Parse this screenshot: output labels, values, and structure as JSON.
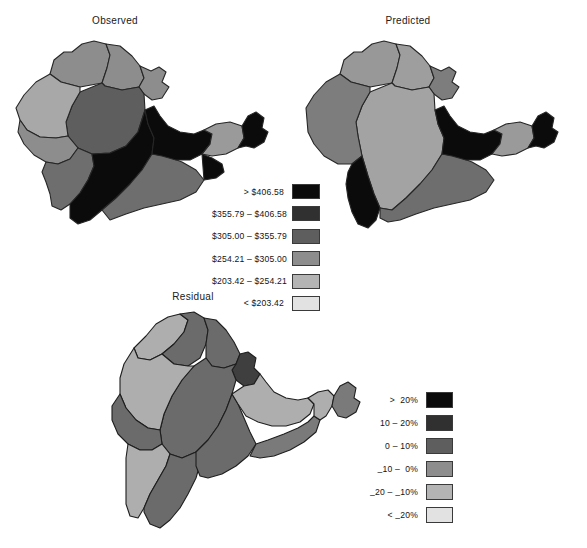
{
  "figure": {
    "background_color": "#ffffff",
    "maps": [
      {
        "id": "observed",
        "title": "Observed",
        "legend_ref": "currency"
      },
      {
        "id": "predicted",
        "title": "Predicted",
        "legend_ref": "currency"
      },
      {
        "id": "residual",
        "title": "Residual",
        "legend_ref": "residual"
      }
    ]
  },
  "legends": {
    "currency": {
      "rows": [
        {
          "label": "> $406.58",
          "color": "#0b0b0b"
        },
        {
          "label": "$355.79 – $406.58",
          "color": "#303030"
        },
        {
          "label": "$305.00 – $355.79",
          "color": "#5e5e5e"
        },
        {
          "label": "$254.21 – $305.00",
          "color": "#8d8d8d"
        },
        {
          "label": "$203.42 – $254.21",
          "color": "#b4b4b4"
        },
        {
          "label": "< $203.42",
          "color": "#e2e2e2"
        }
      ]
    },
    "residual": {
      "rows": [
        {
          "label_html": "&gt;&nbsp; 20%",
          "color": "#0b0b0b"
        },
        {
          "label_html": "10 &ndash; 20%",
          "color": "#303030"
        },
        {
          "label_html": "0 &ndash; 10%",
          "color": "#5e5e5e"
        },
        {
          "label_html": "<span class=\"minus-low\">&ndash;</span>10 &ndash;&nbsp; 0%",
          "color": "#8d8d8d"
        },
        {
          "label_html": "<span class=\"minus-low\">&ndash;</span>20 &ndash; <span class=\"minus-low\">&ndash;</span>10%",
          "color": "#b4b4b4"
        },
        {
          "label_html": "&lt; <span class=\"minus-low\">&ndash;</span>20%",
          "color": "#e2e2e2"
        }
      ]
    }
  },
  "chart_data": {
    "type": "map",
    "panels": [
      {
        "name": "Observed",
        "variable": "value (US dollars)",
        "class_breaks": [
          "< $203.42",
          "$203.42 – $254.21",
          "$254.21 – $305.00",
          "$305.00 – $355.79",
          "$355.79 – $406.58",
          "> $406.58"
        ],
        "regions": [
          {
            "id": "obs-nw",
            "class": "$305.00 – $355.79",
            "color": "#8d8d8d"
          },
          {
            "id": "obs-n",
            "class": "$254.21 – $305.00",
            "color": "#8d8d8d"
          },
          {
            "id": "obs-ne",
            "class": "$305.00 – $355.79",
            "color": "#8d8d8d"
          },
          {
            "id": "obs-ne-lobe",
            "class": "$355.79 – $406.58",
            "color": "#5e5e5e"
          },
          {
            "id": "obs-center",
            "class": "$254.21 – $305.00",
            "color": "#a8a8a8"
          },
          {
            "id": "obs-w",
            "class": "$254.21 – $305.00",
            "color": "#8d8d8d"
          },
          {
            "id": "obs-sw",
            "class": "$305.00 – $355.79",
            "color": "#6e6e6e"
          },
          {
            "id": "obs-s-dark",
            "class": "> $406.58",
            "color": "#0b0b0b"
          },
          {
            "id": "obs-se",
            "class": "$305.00 – $355.79",
            "color": "#6e6e6e"
          },
          {
            "id": "obs-e-dark",
            "class": "> $406.58",
            "color": "#0b0b0b"
          },
          {
            "id": "obs-e-light",
            "class": "$254.21 – $305.00",
            "color": "#9a9a9a"
          },
          {
            "id": "obs-tail-dark",
            "class": "> $406.58",
            "color": "#0b0b0b"
          }
        ]
      },
      {
        "name": "Predicted",
        "variable": "value (US dollars)",
        "class_breaks": [
          "< $203.42",
          "$203.42 – $254.21",
          "$254.21 – $305.00",
          "$305.00 – $355.79",
          "$355.79 – $406.58",
          "> $406.58"
        ],
        "regions": [
          {
            "id": "pre-nw",
            "class": "$254.21 – $305.00",
            "color": "#989898"
          },
          {
            "id": "pre-n",
            "class": "$254.21 – $305.00",
            "color": "#9e9e9e"
          },
          {
            "id": "pre-ne",
            "class": "$305.00 – $355.79",
            "color": "#7d7d7d"
          },
          {
            "id": "pre-center",
            "class": "$254.21 – $305.00",
            "color": "#a3a3a3"
          },
          {
            "id": "pre-w",
            "class": "$305.00 – $355.79",
            "color": "#7d7d7d"
          },
          {
            "id": "pre-sw-dark",
            "class": "> $406.58",
            "color": "#0b0b0b"
          },
          {
            "id": "pre-s",
            "class": "$305.00 – $355.79",
            "color": "#6e6e6e"
          },
          {
            "id": "pre-e-dark",
            "class": "> $406.58",
            "color": "#0b0b0b"
          },
          {
            "id": "pre-e-light",
            "class": "$254.21 – $305.00",
            "color": "#9a9a9a"
          },
          {
            "id": "pre-tail-dark",
            "class": "> $406.58",
            "color": "#0b0b0b"
          }
        ]
      },
      {
        "name": "Residual",
        "variable": "residual (percent)",
        "class_breaks": [
          "< –20%",
          "–20 – –10%",
          "–10 – 0%",
          "0 – 10%",
          "10 – 20%",
          "> 20%"
        ],
        "regions": [
          {
            "id": "res-nw-light",
            "class": "–20 – –10%",
            "color": "#aeaeae"
          },
          {
            "id": "res-n",
            "class": "0 – 10%",
            "color": "#6b6b6b"
          },
          {
            "id": "res-ne",
            "class": "0 – 10%",
            "color": "#6b6b6b"
          },
          {
            "id": "res-center",
            "class": "10 – 20%",
            "color": "#3f3f3f"
          },
          {
            "id": "res-w",
            "class": "0 – 10%",
            "color": "#6b6b6b"
          },
          {
            "id": "res-w-light",
            "class": "–20 – –10%",
            "color": "#aeaeae"
          },
          {
            "id": "res-sw",
            "class": "0 – 10%",
            "color": "#6b6b6b"
          },
          {
            "id": "res-s-light",
            "class": "–20 – –10%",
            "color": "#aeaeae"
          },
          {
            "id": "res-s",
            "class": "0 – 10%",
            "color": "#6b6b6b"
          },
          {
            "id": "res-e",
            "class": "0 – 10%",
            "color": "#6b6b6b"
          },
          {
            "id": "res-e-light",
            "class": "–20 – –10%",
            "color": "#aeaeae"
          },
          {
            "id": "res-tail",
            "class": "0 – 10%",
            "color": "#7a7a7a"
          }
        ]
      }
    ]
  }
}
